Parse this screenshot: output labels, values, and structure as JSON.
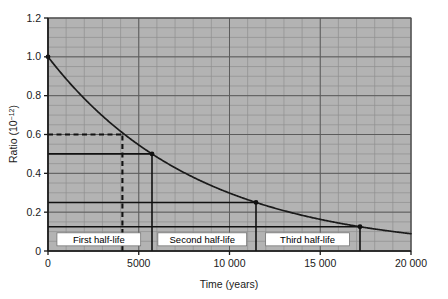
{
  "chart_data": {
    "type": "line",
    "title": "",
    "subtitle": "",
    "xlabel": "Time (years)",
    "ylabel": "Ratio (10⁻¹²)",
    "ylabel_base": "Ratio (10",
    "ylabel_exp": "−12",
    "ylabel_close": ")",
    "xlim": [
      0,
      20000
    ],
    "ylim": [
      0,
      1.2
    ],
    "xticks": [
      0,
      5000,
      10000,
      15000,
      20000
    ],
    "xtick_labels": [
      "0",
      "5000",
      "10 000",
      "15 000",
      "20 000"
    ],
    "yticks": [
      0,
      0.2,
      0.4,
      0.6,
      0.8,
      1.0,
      1.2
    ],
    "ytick_labels": [
      "0",
      "0.2",
      "0.4",
      "0.6",
      "0.8",
      "1.0",
      "1.2"
    ],
    "grid": "major and minor",
    "grid_minor_x_step": 1000,
    "grid_minor_y_step": 0.05,
    "legend": "none",
    "plot_background": "#b3b3b3",
    "curve_color": "#1a1a1a",
    "gridline_color": "#7a7a7a",
    "series": [
      {
        "name": "Carbon-14 ratio decay",
        "description": "Exponential decay curve, half-life 5730 years",
        "x": [
          0,
          500,
          1000,
          1500,
          2000,
          2500,
          3000,
          3500,
          4000,
          4500,
          5000,
          5730,
          6500,
          7500,
          8500,
          10000,
          11460,
          13000,
          14500,
          16000,
          17190,
          18500,
          20000
        ],
        "y": [
          1.0,
          0.942,
          0.886,
          0.834,
          0.785,
          0.739,
          0.696,
          0.655,
          0.616,
          0.58,
          0.546,
          0.5,
          0.456,
          0.404,
          0.358,
          0.298,
          0.25,
          0.208,
          0.174,
          0.145,
          0.125,
          0.104,
          0.0853
        ]
      }
    ],
    "markers": [
      {
        "name": "curve-start",
        "x": 0,
        "y": 1.0
      },
      {
        "name": "first-half-life-point",
        "x": 5730,
        "y": 0.5
      },
      {
        "name": "second-half-life-point",
        "x": 11460,
        "y": 0.25
      },
      {
        "name": "third-half-life-point",
        "x": 17190,
        "y": 0.125
      }
    ],
    "guides": [
      {
        "name": "dashed-ratio-0.6",
        "style": "dashed",
        "orientation": "horizontal",
        "y": 0.6,
        "x_from": 0,
        "x_to": 4100
      },
      {
        "name": "dashed-time-4100",
        "style": "dashed",
        "orientation": "vertical",
        "x": 4100,
        "y_from": 0,
        "y_to": 0.6
      },
      {
        "name": "solid-ratio-0.5",
        "style": "solid",
        "orientation": "horizontal",
        "y": 0.5,
        "x_from": 0,
        "x_to": 5730
      },
      {
        "name": "solid-time-5730",
        "style": "solid",
        "orientation": "vertical",
        "x": 5730,
        "y_from": 0,
        "y_to": 0.5
      },
      {
        "name": "solid-ratio-0.25",
        "style": "solid",
        "orientation": "horizontal",
        "y": 0.25,
        "x_from": 0,
        "x_to": 11460
      },
      {
        "name": "solid-time-11460",
        "style": "solid",
        "orientation": "vertical",
        "x": 11460,
        "y_from": 0,
        "y_to": 0.25
      },
      {
        "name": "solid-ratio-0.125",
        "style": "solid",
        "orientation": "horizontal",
        "y": 0.125,
        "x_from": 0,
        "x_to": 17190
      },
      {
        "name": "solid-time-17190",
        "style": "solid",
        "orientation": "vertical",
        "x": 17190,
        "y_from": 0,
        "y_to": 0.125
      }
    ],
    "annotations": [
      {
        "name": "first-half-life",
        "text": "First half-life",
        "x": 2800,
        "y": 0.06
      },
      {
        "name": "second-half-life",
        "text": "Second half-life",
        "x": 8500,
        "y": 0.06
      },
      {
        "name": "third-half-life",
        "text": "Third half-life",
        "x": 14300,
        "y": 0.06
      }
    ]
  },
  "axes": {
    "x": {
      "title": "Time (years)",
      "labels": [
        "0",
        "5000",
        "10 000",
        "15 000",
        "20 000"
      ]
    },
    "y": {
      "title_base": "Ratio (10",
      "title_exp": "−12",
      "title_close": ")",
      "labels": [
        "1.2",
        "1.0",
        "0.8",
        "0.6",
        "0.4",
        "0.2",
        "0"
      ]
    }
  },
  "annotation_labels": {
    "first": "First half-life",
    "second": "Second half-life",
    "third": "Third half-life"
  }
}
